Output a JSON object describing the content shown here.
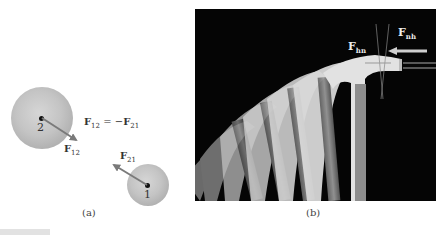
{
  "figure": {
    "panel_a": {
      "caption": "(a)",
      "equation": {
        "lhs_base": "F",
        "lhs_sub": "12",
        "operator": " = −",
        "rhs_base": "F",
        "rhs_sub": "21"
      },
      "particles": [
        {
          "id": "2",
          "label": "2",
          "radius": "large"
        },
        {
          "id": "1",
          "label": "1",
          "radius": "small"
        }
      ],
      "force_vectors": [
        {
          "name": "F12",
          "base": "F",
          "sub": "12",
          "on_particle": "2",
          "direction": "toward particle 1 (down-right)"
        },
        {
          "name": "F21",
          "base": "F",
          "sub": "21",
          "on_particle": "1",
          "direction": "toward particle 2 (up-left)"
        }
      ],
      "colors": {
        "sphere": "#bdbdbd",
        "arrow": "#7a7a7a",
        "dot": "#111111"
      }
    },
    "panel_b": {
      "caption": "(b)",
      "description": "Stroboscopic photo of a hammer striking a nail",
      "labels": [
        {
          "name": "Fhn",
          "base": "F",
          "sub": "hn"
        },
        {
          "name": "Fnh",
          "base": "F",
          "sub": "nh"
        }
      ],
      "colors": {
        "background": "#050505",
        "hammer": "#d8d8d8",
        "label": "#ececec"
      }
    }
  }
}
